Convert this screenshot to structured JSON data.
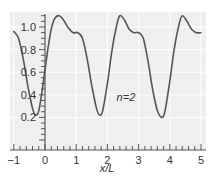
{
  "chart_data": {
    "type": "line",
    "title": "",
    "xlabel": "x/L",
    "ylabel": "",
    "xlim": [
      -1,
      5
    ],
    "ylim": [
      0,
      1.1
    ],
    "x_ticks": [
      -1,
      0,
      1,
      2,
      3,
      4,
      5
    ],
    "x_tick_labels": [
      "−1",
      "0",
      "1",
      "2",
      "3",
      "4",
      "5"
    ],
    "y_ticks": [
      0.2,
      0.4,
      0.6,
      0.8,
      1.0
    ],
    "y_tick_labels": [
      "0.2",
      "0.4",
      "0.6",
      "0.8",
      "1.0"
    ],
    "grid": true,
    "annotations": [
      {
        "text": "n=2",
        "x": 3.0,
        "y": 0.38
      }
    ],
    "series": [
      {
        "name": "n=2",
        "color": "#555555",
        "x": [
          -1.0,
          -0.85,
          -0.7,
          -0.55,
          -0.4,
          -0.3,
          -0.2,
          -0.1,
          0.0,
          0.1,
          0.2,
          0.3,
          0.45,
          0.6,
          0.75,
          0.9,
          1.05,
          1.2,
          1.35,
          1.5,
          1.65,
          1.75,
          1.85,
          2.0,
          2.15,
          2.3,
          2.4,
          2.55,
          2.7,
          2.85,
          3.0,
          3.15,
          3.3,
          3.45,
          3.6,
          3.75,
          3.85,
          4.0,
          4.15,
          4.3,
          4.4,
          4.55,
          4.7,
          4.85,
          5.0
        ],
        "y": [
          0.96,
          0.9,
          0.72,
          0.48,
          0.28,
          0.22,
          0.26,
          0.42,
          0.62,
          0.82,
          0.98,
          1.07,
          1.1,
          1.06,
          0.99,
          0.95,
          0.95,
          0.9,
          0.72,
          0.48,
          0.28,
          0.22,
          0.26,
          0.5,
          0.8,
          1.02,
          1.1,
          1.06,
          0.98,
          0.95,
          0.95,
          0.9,
          0.7,
          0.45,
          0.26,
          0.2,
          0.26,
          0.52,
          0.82,
          1.03,
          1.1,
          1.05,
          0.98,
          0.95,
          0.95
        ]
      }
    ]
  },
  "layout": {
    "plot_left": 10,
    "plot_right": 206,
    "plot_top": 12,
    "plot_bottom": 150,
    "x0_px": 45,
    "px_per_x": 31.2,
    "y0_px": 140,
    "px_per_y": 113,
    "x_axis_y": 150,
    "y_axis_x": 45,
    "bg_color": "#efefef",
    "grid_color": "#ffffff",
    "axis_color": "#555555"
  }
}
